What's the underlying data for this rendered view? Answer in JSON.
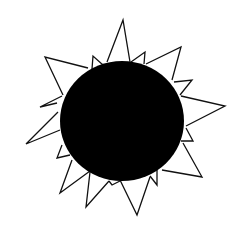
{
  "image": {
    "subject": "hand-drawn sun",
    "background": "#ffffff",
    "colors": {
      "fill": "#000000",
      "stroke": "#111111"
    },
    "sun_body": {
      "cx": 122,
      "cy": 121,
      "rx": 62,
      "ry": 60
    },
    "rays": [
      {
        "points": "107,62 123,20 130,62"
      },
      {
        "points": "92,69 93,56 103,65"
      },
      {
        "points": "131,62 145,52 144,64"
      },
      {
        "points": "146,64 181,47 172,80"
      },
      {
        "points": "174,82 192,80 180,95"
      },
      {
        "points": "181,96 225,106 186,126"
      },
      {
        "points": "186,128 193,141 181,141"
      },
      {
        "points": "183,143 202,177 162,170"
      },
      {
        "points": "157,170 157,185 150,176"
      },
      {
        "points": "150,177 137,215 120,180"
      },
      {
        "points": "120,181 112,185 109,181"
      },
      {
        "points": "109,181 86,207 90,172"
      },
      {
        "points": "90,171 60,193 72,160"
      },
      {
        "points": "70,155 57,158 62,145"
      },
      {
        "points": "60,130 26,144 58,112"
      },
      {
        "points": "57,103 40,107 62,96"
      },
      {
        "points": "63,95 45,57 88,68"
      }
    ]
  }
}
